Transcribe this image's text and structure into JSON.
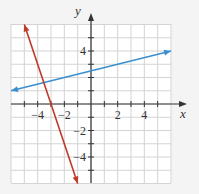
{
  "chart_data": {
    "type": "line",
    "title": "",
    "xlabel": "x",
    "ylabel": "y",
    "xlim": [
      -6,
      6
    ],
    "ylim": [
      -6,
      6
    ],
    "grid": true,
    "grid_step": 1,
    "x_tick_labels": [
      {
        "value": -4,
        "label": "−4"
      },
      {
        "value": -2,
        "label": "−2"
      },
      {
        "value": 2,
        "label": "2"
      },
      {
        "value": 4,
        "label": "4"
      }
    ],
    "y_tick_labels": [
      {
        "value": 4,
        "label": "4"
      },
      {
        "value": -2,
        "label": "−2"
      },
      {
        "value": -4,
        "label": "−4"
      }
    ],
    "series": [
      {
        "name": "blue line",
        "color": "#3a8fd0",
        "equation": "y = 0.25x + 2.5",
        "x": [
          -6,
          6
        ],
        "y": [
          1,
          4
        ],
        "arrows": "both"
      },
      {
        "name": "red line",
        "color": "#c0392b",
        "equation": "y = -3x - 9",
        "x": [
          -5,
          -1
        ],
        "y": [
          6,
          -6
        ],
        "arrows": "both"
      }
    ],
    "legend": null
  },
  "colors": {
    "grid": "#d8d8d8",
    "axis": "#333333",
    "frame_bg": "#f4f4f4"
  }
}
